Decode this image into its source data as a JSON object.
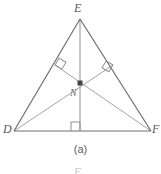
{
  "figure": {
    "caption": "(a)",
    "shape_name": "triangle",
    "vertices": [
      {
        "id": "E",
        "label": "E",
        "x": 80,
        "y": 19
      },
      {
        "id": "D",
        "label": "D",
        "x": 14,
        "y": 131
      },
      {
        "id": "F",
        "label": "F",
        "x": 151,
        "y": 131
      }
    ],
    "interior_point": {
      "id": "N",
      "label": "N",
      "x": 80,
      "y": 83,
      "marker": "filled-square"
    },
    "sides": [
      {
        "name": "DE",
        "from": "D",
        "to": "E"
      },
      {
        "name": "EF",
        "from": "E",
        "to": "F"
      },
      {
        "name": "DF",
        "from": "D",
        "to": "F"
      }
    ],
    "altitudes": [
      {
        "name": "altitude-from-E",
        "from": "E",
        "foot_x": 80,
        "foot_y": 131
      },
      {
        "name": "altitude-from-D",
        "from": "D",
        "foot_x": 113,
        "foot_y": 65
      },
      {
        "name": "altitude-from-F",
        "from": "F",
        "foot_x": 55,
        "foot_y": 65
      }
    ],
    "right_angle_marks": [
      {
        "name": "right-angle-on-DE",
        "x": 55,
        "y": 65,
        "size": 8,
        "rotation": -59
      },
      {
        "name": "right-angle-on-EF",
        "x": 113,
        "y": 65,
        "size": 8,
        "rotation": 59
      },
      {
        "name": "right-angle-on-DF",
        "x": 80,
        "y": 131,
        "size": 9,
        "rotation": 0
      }
    ],
    "clipped_next_label": "E",
    "colors": {
      "side_stroke": "#6e6e6e",
      "altitude_stroke": "#a3a3a3",
      "right_angle_stroke": "#8f8f8f",
      "point_marker": "#454545",
      "label_text": "#595959",
      "caption_text": "#5d5d5d",
      "background": "#ffffff"
    }
  }
}
